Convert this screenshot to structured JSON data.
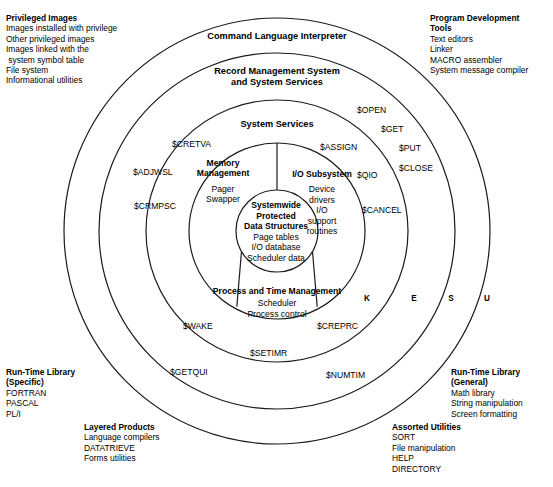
{
  "diagram": {
    "geometry": {
      "center_x": 277,
      "center_y": 231,
      "radii": [
        213,
        178,
        131,
        88,
        41
      ]
    }
  },
  "rings": [
    {
      "name": "command-language-interpreter",
      "label": "Command Language Interpreter"
    },
    {
      "name": "record-management-system",
      "label_line1": "Record Management System",
      "label_line2": "and System Services"
    },
    {
      "name": "system-services",
      "label": "System Services"
    }
  ],
  "segments": {
    "memory_management": {
      "title": "Memory\nManagement",
      "title_line1": "Memory",
      "title_line2": "Management",
      "items_line1": "Pager",
      "items_line2": "Swapper"
    },
    "io_subsystem": {
      "title": "I/O Subsystem",
      "items_line1": "Device",
      "items_line2": "drivers",
      "items_line3": "I/O",
      "items_line4": "support",
      "items_line5": "routines"
    },
    "process_time_management": {
      "title": "Process and Time Management",
      "items_line1": "Scheduler",
      "items_line2": "Process control"
    }
  },
  "core": {
    "title_line1": "Systemwide",
    "title_line2": "Protected",
    "title_line3": "Data Structures",
    "item_line1": "Page tables",
    "item_line2": "I/O database",
    "item_line3": "Scheduler data"
  },
  "system_services": [
    {
      "name": "service-cretva",
      "label": "$CRETVA"
    },
    {
      "name": "service-adjwsl",
      "label": "$ADJWSL"
    },
    {
      "name": "service-crmpsc",
      "label": "$CRMPSC"
    },
    {
      "name": "service-open",
      "label": "$OPEN"
    },
    {
      "name": "service-get",
      "label": "$GET"
    },
    {
      "name": "service-put",
      "label": "$PUT"
    },
    {
      "name": "service-close",
      "label": "$CLOSE"
    },
    {
      "name": "service-assign",
      "label": "$ASSIGN"
    },
    {
      "name": "service-qio",
      "label": "$QIO"
    },
    {
      "name": "service-cancel",
      "label": "$CANCEL"
    },
    {
      "name": "service-wake",
      "label": "$WAKE"
    },
    {
      "name": "service-creprc",
      "label": "$CREPRC"
    },
    {
      "name": "service-setimr",
      "label": "$SETIMR"
    },
    {
      "name": "service-getqui",
      "label": "$GETQUI"
    },
    {
      "name": "service-numtim",
      "label": "$NUMTIM"
    }
  ],
  "access_modes": [
    {
      "name": "mode-kernel",
      "label": "K"
    },
    {
      "name": "mode-executive",
      "label": "E"
    },
    {
      "name": "mode-supervisor",
      "label": "S"
    },
    {
      "name": "mode-user",
      "label": "U"
    }
  ],
  "corner_blocks": {
    "privileged_images": {
      "heading": "Privileged Images",
      "items": [
        "Images installed with privilege",
        "Other privileged images",
        "Images linked with the",
        " system symbol table",
        "File system",
        "Informational utilities"
      ]
    },
    "program_development_tools": {
      "heading_line1": "Program Development",
      "heading_line2": "Tools",
      "items": [
        "Text editors",
        "Linker",
        "MACRO assembler",
        "System message compiler"
      ]
    },
    "runtime_library_specific": {
      "heading_line1": "Run-Time Library",
      "heading_line2": "(Specific)",
      "items": [
        "FORTRAN",
        "PASCAL",
        "PL/I"
      ]
    },
    "layered_products": {
      "heading": "Layered Products",
      "items": [
        "Language compilers",
        "DATATRIEVE",
        "Forms utilities"
      ]
    },
    "runtime_library_general": {
      "heading_line1": "Run-Time Library",
      "heading_line2": "(General)",
      "items": [
        "Math library",
        "String manipulation",
        "Screen formatting"
      ]
    },
    "assorted_utilities": {
      "heading": "Assorted Utilities",
      "items": [
        "SORT",
        "File manipulation",
        "HELP",
        "DIRECTORY"
      ]
    }
  },
  "colors": {
    "stroke": "#1a1a1a",
    "background": "#ffffff",
    "text": "#000000"
  }
}
